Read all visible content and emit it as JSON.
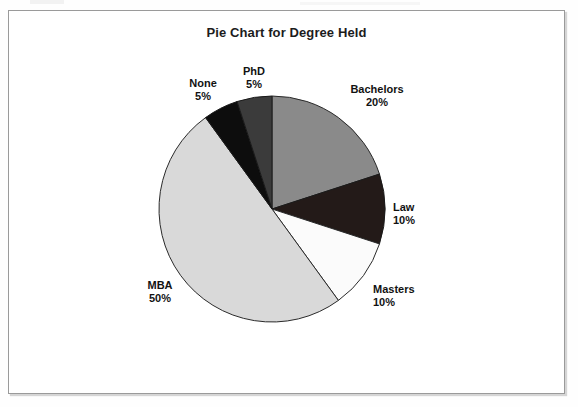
{
  "chart_data": {
    "type": "pie",
    "title": "Pie Chart for Degree Held",
    "xlabel": "",
    "ylabel": "",
    "legend": "none",
    "grid": false,
    "start_angle_deg": 0,
    "direction": "clockwise",
    "categories": [
      "Bachelors",
      "Law",
      "Masters",
      "MBA",
      "None",
      "PhD"
    ],
    "values": [
      20,
      10,
      10,
      50,
      5,
      5
    ],
    "value_unit": "percent",
    "slices": [
      {
        "name": "Bachelors",
        "label": "Bachelors",
        "percent": 20,
        "percent_text": "20%",
        "sweep_deg": 72,
        "start_deg": 0,
        "end_deg": 72,
        "fill": "#8a8a8a",
        "stroke": "#2a2a2a",
        "label_align": "center"
      },
      {
        "name": "Law",
        "label": "Law",
        "percent": 10,
        "percent_text": "10%",
        "sweep_deg": 36,
        "start_deg": 72,
        "end_deg": 108,
        "fill": "#231a18",
        "stroke": "#1a1a1a",
        "label_align": "left"
      },
      {
        "name": "Masters",
        "label": "Masters",
        "percent": 10,
        "percent_text": "10%",
        "sweep_deg": 36,
        "start_deg": 108,
        "end_deg": 144,
        "fill": "#fbfbfb",
        "stroke": "#2a2a2a",
        "label_align": "left"
      },
      {
        "name": "MBA",
        "label": "MBA",
        "percent": 50,
        "percent_text": "50%",
        "sweep_deg": 180,
        "start_deg": 144,
        "end_deg": 324,
        "fill": "#d9d9d9",
        "stroke": "#2a2a2a",
        "label_align": "center"
      },
      {
        "name": "None",
        "label": "None",
        "percent": 5,
        "percent_text": "5%",
        "sweep_deg": 18,
        "start_deg": 324,
        "end_deg": 342,
        "fill": "#0d0d0d",
        "stroke": "#1a1a1a",
        "label_align": "center"
      },
      {
        "name": "PhD",
        "label": "PhD",
        "percent": 5,
        "percent_text": "5%",
        "sweep_deg": 18,
        "start_deg": 342,
        "end_deg": 360,
        "fill": "#3b3b3b",
        "stroke": "#1a1a1a",
        "label_align": "center"
      }
    ],
    "geometry": {
      "center_x": 263,
      "center_y": 198,
      "radius": 113
    },
    "colors": {
      "frame_border": "#9a9a9a",
      "background": "#ffffff",
      "text": "#121212",
      "outline": "#2a2a2a"
    }
  }
}
